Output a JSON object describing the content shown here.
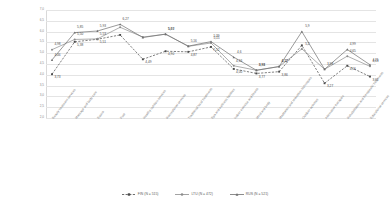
{
  "chart_data": {
    "type": "line",
    "title": "",
    "xlabel": "",
    "ylabel": "",
    "ylim": [
      1.5,
      7.0
    ],
    "yticks": [
      "7,0",
      "6,5",
      "6,0",
      "5,5",
      "5,0",
      "4,5",
      "4,0",
      "3,5",
      "3,0",
      "2,5",
      "2,0"
    ],
    "grid": true,
    "legend_position": "bottom",
    "categories": [
      "Beauty treatment services",
      "Massage and body care",
      "Sauna",
      "Pool",
      "Healthy nutrition services",
      "Recreational services",
      "Traditional local treatments",
      "Spa and wellness facilities",
      "Indoor exercise and fitness",
      "Mind and body",
      "Meditation and relaxation techniques",
      "Outdoor activities",
      "Alternative therapies",
      "Rehabilitation and therapeutic treatments",
      "Educational services"
    ],
    "series": [
      {
        "name": "FIN (N = 515)",
        "color": "#4a4a4a",
        "style": "dashed",
        "marker": "square",
        "values": [
          3.73,
          5.38,
          5.51,
          5.73,
          4.49,
          4.9,
          4.87,
          5.12,
          4.0,
          3.77,
          3.86,
          5.2,
          3.27,
          4.16,
          3.61
        ]
      },
      {
        "name": "LTU (N = 472)",
        "color": "#8c8c8c",
        "style": "solid",
        "marker": "circle",
        "values": [
          4.98,
          5.5,
          5.53,
          6.12,
          5.62,
          5.77,
          5.15,
          5.32,
          4.16,
          3.93,
          4.12,
          5.02,
          3.98,
          4.65,
          4.13
        ]
      },
      {
        "name": "RUS (N = 521)",
        "color": "#6f6f6f",
        "style": "solid",
        "marker": "triangle",
        "values": [
          4.46,
          5.85,
          5.93,
          6.27,
          5.6,
          5.77,
          5.16,
          5.39,
          4.6,
          3.93,
          4.12,
          5.9,
          3.98,
          4.99,
          4.21
        ]
      }
    ],
    "point_labels": [
      {
        "series": 0,
        "index": 0,
        "text": "3,73"
      },
      {
        "series": 0,
        "index": 1,
        "text": "5,38"
      },
      {
        "series": 0,
        "index": 2,
        "text": "5,51"
      },
      {
        "series": 0,
        "index": 4,
        "text": "4,49"
      },
      {
        "series": 0,
        "index": 5,
        "text": "4,90"
      },
      {
        "series": 0,
        "index": 6,
        "text": "4,87"
      },
      {
        "series": 0,
        "index": 7,
        "text": "5,12"
      },
      {
        "series": 0,
        "index": 8,
        "text": "4,00"
      },
      {
        "series": 0,
        "index": 9,
        "text": "3,77"
      },
      {
        "series": 0,
        "index": 10,
        "text": "3,86"
      },
      {
        "series": 0,
        "index": 12,
        "text": "3,27"
      },
      {
        "series": 0,
        "index": 13,
        "text": "4,16"
      },
      {
        "series": 0,
        "index": 14,
        "text": "3,61"
      },
      {
        "series": 1,
        "index": 0,
        "text": "4,98"
      },
      {
        "series": 1,
        "index": 1,
        "text": "5,50"
      },
      {
        "series": 1,
        "index": 2,
        "text": "5,53"
      },
      {
        "series": 1,
        "index": 5,
        "text": "5,60"
      },
      {
        "series": 1,
        "index": 7,
        "text": "5,15"
      },
      {
        "series": 1,
        "index": 8,
        "text": "4,16"
      },
      {
        "series": 1,
        "index": 9,
        "text": "3,93"
      },
      {
        "series": 1,
        "index": 10,
        "text": "4,12"
      },
      {
        "series": 1,
        "index": 11,
        "text": "5,2"
      },
      {
        "series": 1,
        "index": 12,
        "text": "3,98"
      },
      {
        "series": 1,
        "index": 13,
        "text": "4,65"
      },
      {
        "series": 1,
        "index": 14,
        "text": "4,13"
      },
      {
        "series": 2,
        "index": 0,
        "text": "4,46"
      },
      {
        "series": 2,
        "index": 1,
        "text": "5,85"
      },
      {
        "series": 2,
        "index": 2,
        "text": "5,93"
      },
      {
        "series": 2,
        "index": 3,
        "text": "6,27"
      },
      {
        "series": 2,
        "index": 5,
        "text": "5,77"
      },
      {
        "series": 2,
        "index": 6,
        "text": "5,16"
      },
      {
        "series": 2,
        "index": 7,
        "text": "5,39"
      },
      {
        "series": 2,
        "index": 8,
        "text": "4,6"
      },
      {
        "series": 2,
        "index": 9,
        "text": "3,93"
      },
      {
        "series": 2,
        "index": 10,
        "text": "4,12"
      },
      {
        "series": 2,
        "index": 11,
        "text": "5,9"
      },
      {
        "series": 2,
        "index": 13,
        "text": "4,99"
      },
      {
        "series": 2,
        "index": 14,
        "text": "4,21"
      }
    ]
  }
}
